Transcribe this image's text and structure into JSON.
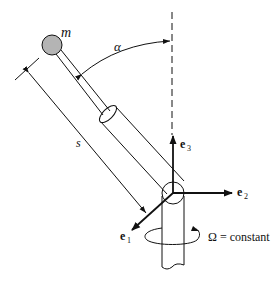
{
  "diagram": {
    "labels": {
      "mass": "m",
      "angle": "α",
      "length": "s",
      "e1_base": "e",
      "e1_sub": "1",
      "e2_base": "e",
      "e2_sub": "2",
      "e3_base": "e",
      "e3_sub": "3",
      "omega": "Ω = constant"
    },
    "colors": {
      "line": "#111111",
      "mass_fill": "#b4b4b4",
      "background": "#ffffff"
    }
  }
}
